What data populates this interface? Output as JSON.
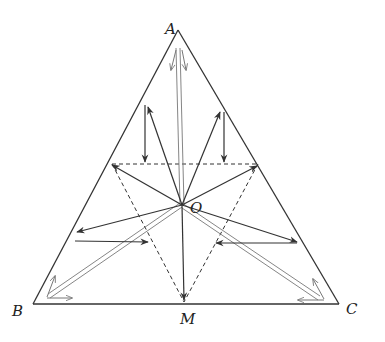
{
  "diagram": {
    "type": "equilateral triangle with vectors from centroid",
    "labels": {
      "A": "A",
      "B": "B",
      "C": "C",
      "M": "M",
      "O": "O"
    },
    "colors": {
      "stroke": "#333333",
      "double_line": "#666666",
      "background": "#ffffff"
    },
    "points": {
      "A": [
        178,
        30
      ],
      "B": [
        33,
        304
      ],
      "C": [
        339,
        304
      ],
      "M": [
        184,
        304
      ],
      "O": [
        182,
        205
      ]
    }
  }
}
